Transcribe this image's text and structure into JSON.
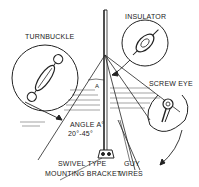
{
  "labels": {
    "turnbuckle": "TURNBUCKLE",
    "insulator": "INSULATOR",
    "screw_eye": "SCREW EYE",
    "angle": "ANGLE A°",
    "angle_range": "20°-45°",
    "bracket_line1": "SWIVEL TYPE",
    "bracket_line2": "MOUNTING BRACKET",
    "guy_line1": "GUY",
    "guy_line2": "WIRES",
    "angle_marker": "A"
  },
  "colors": {
    "ink": "#222222",
    "background": "#ffffff"
  }
}
